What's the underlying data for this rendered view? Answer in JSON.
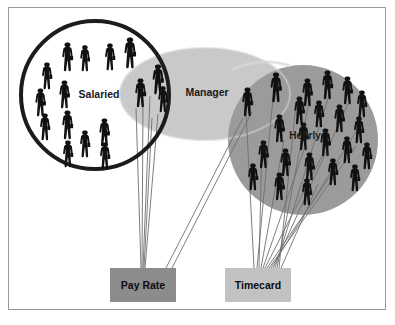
{
  "diagram": {
    "background_color": "#ffffff",
    "frame_color": "#9a9a9a",
    "groups": [
      {
        "id": "salaried",
        "label": "Salaried",
        "shape": "circle",
        "fill": "#ffffff",
        "stroke": "#1c1c1c",
        "stroke_width": 4,
        "cx": 95,
        "cy": 95,
        "r": 74,
        "label_x": 99,
        "label_y": 95,
        "person_count": 16
      },
      {
        "id": "manager",
        "label": "Manager",
        "shape": "ellipse",
        "fill": "#c9c9c9",
        "stroke": "none",
        "cx": 205,
        "cy": 94,
        "rx": 85,
        "ry": 46,
        "label_x": 207,
        "label_y": 93,
        "person_count": 5
      },
      {
        "id": "hourly",
        "label": "Hourly",
        "shape": "circle",
        "fill": "#9b9b9b",
        "stroke": "none",
        "cx": 303,
        "cy": 140,
        "r": 75,
        "label_x": 305,
        "label_y": 136,
        "person_count": 23
      }
    ],
    "targets": [
      {
        "id": "pay-rate",
        "label": "Pay Rate",
        "fill": "#8c8c8c",
        "text_color": "#0d0d0d",
        "x": 110,
        "y": 268,
        "width": 66,
        "height": 34
      },
      {
        "id": "timecard",
        "label": "Timecard",
        "fill": "#c2c2c2",
        "text_color": "#0d0d0d",
        "x": 225,
        "y": 268,
        "width": 66,
        "height": 34
      }
    ],
    "connector_color": "#6f6f6f",
    "connectors": {
      "salaried_to_pay_rate_count": 5,
      "manager_to_pay_rate_count": 2,
      "hourly_to_timecard_count": 14
    },
    "person_silhouette_color": "#111111",
    "people": {
      "salaried": [
        {
          "x": 60,
          "y": 42,
          "h": 30
        },
        {
          "x": 78,
          "y": 45,
          "h": 27
        },
        {
          "x": 103,
          "y": 43,
          "h": 28
        },
        {
          "x": 122,
          "y": 37,
          "h": 32
        },
        {
          "x": 40,
          "y": 62,
          "h": 28
        },
        {
          "x": 57,
          "y": 80,
          "h": 29
        },
        {
          "x": 33,
          "y": 88,
          "h": 29
        },
        {
          "x": 38,
          "y": 113,
          "h": 28
        },
        {
          "x": 60,
          "y": 110,
          "h": 30
        },
        {
          "x": 78,
          "y": 130,
          "h": 28
        },
        {
          "x": 97,
          "y": 118,
          "h": 29
        },
        {
          "x": 61,
          "y": 140,
          "h": 28
        },
        {
          "x": 98,
          "y": 142,
          "h": 28
        },
        {
          "x": 133,
          "y": 78,
          "h": 30
        },
        {
          "x": 150,
          "y": 64,
          "h": 31
        },
        {
          "x": 156,
          "y": 86,
          "h": 27
        }
      ],
      "manager": [
        {
          "x": 133,
          "y": 78,
          "h": 30
        },
        {
          "x": 150,
          "y": 64,
          "h": 31
        },
        {
          "x": 156,
          "y": 86,
          "h": 27
        },
        {
          "x": 240,
          "y": 87,
          "h": 30
        },
        {
          "x": 268,
          "y": 72,
          "h": 31
        }
      ],
      "hourly": [
        {
          "x": 240,
          "y": 87,
          "h": 30
        },
        {
          "x": 268,
          "y": 72,
          "h": 31
        },
        {
          "x": 300,
          "y": 78,
          "h": 29
        },
        {
          "x": 320,
          "y": 70,
          "h": 30
        },
        {
          "x": 340,
          "y": 76,
          "h": 29
        },
        {
          "x": 355,
          "y": 90,
          "h": 28
        },
        {
          "x": 292,
          "y": 96,
          "h": 29
        },
        {
          "x": 312,
          "y": 100,
          "h": 28
        },
        {
          "x": 332,
          "y": 104,
          "h": 29
        },
        {
          "x": 352,
          "y": 116,
          "h": 28
        },
        {
          "x": 272,
          "y": 114,
          "h": 29
        },
        {
          "x": 296,
          "y": 122,
          "h": 29
        },
        {
          "x": 318,
          "y": 128,
          "h": 29
        },
        {
          "x": 340,
          "y": 136,
          "h": 28
        },
        {
          "x": 360,
          "y": 142,
          "h": 28
        },
        {
          "x": 256,
          "y": 140,
          "h": 29
        },
        {
          "x": 278,
          "y": 148,
          "h": 29
        },
        {
          "x": 302,
          "y": 152,
          "h": 29
        },
        {
          "x": 326,
          "y": 158,
          "h": 28
        },
        {
          "x": 348,
          "y": 164,
          "h": 28
        },
        {
          "x": 246,
          "y": 163,
          "h": 28
        },
        {
          "x": 272,
          "y": 172,
          "h": 29
        },
        {
          "x": 300,
          "y": 178,
          "h": 28
        }
      ]
    }
  }
}
